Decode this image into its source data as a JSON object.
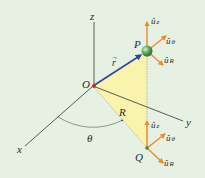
{
  "figure": {
    "background": "#e6f1e3",
    "labels": {
      "z": "z",
      "y": "y",
      "x": "x",
      "origin": "O",
      "point_p": "P",
      "point_q": "Q",
      "r_vector": "r",
      "r_arrow": "→",
      "R": "R",
      "theta": "θ"
    },
    "unit_vectors_p": {
      "z": "û",
      "z_sub": "z",
      "theta": "û",
      "theta_sub": "θ",
      "R": "û",
      "R_sub": "R"
    },
    "unit_vectors_q": {
      "z": "û",
      "z_sub": "z",
      "theta": "û",
      "theta_sub": "θ",
      "R": "û",
      "R_sub": "R"
    },
    "colors": {
      "triangle_fill": "#fbf3a6",
      "r_vector": "#2b4aa0",
      "unit_vector": "#f08a24",
      "sphere": "#5aa55a",
      "origin_dot": "#c0302a",
      "axis": "#333333"
    }
  }
}
